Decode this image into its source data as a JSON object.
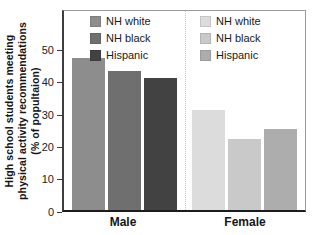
{
  "figure": {
    "ylabel_lines": [
      "High school students meeting",
      "physical activity recommendations",
      "(% of popultaion)"
    ]
  },
  "chart_data": {
    "type": "bar",
    "title": "",
    "ylabel": "High school students meeting physical activity recommendations (% of popultaion)",
    "xlabel": "",
    "categories": [
      "Male",
      "Female"
    ],
    "series": [
      {
        "name": "NH white",
        "values": [
          47,
          31
        ]
      },
      {
        "name": "NH black",
        "values": [
          43,
          22
        ]
      },
      {
        "name": "Hispanic",
        "values": [
          41,
          25
        ]
      }
    ],
    "yticks": [
      0,
      10,
      20,
      30,
      40,
      50
    ],
    "ylim": [
      0,
      62
    ],
    "grid": false,
    "group_separator": "dotted vertical line between Male and Female groups",
    "legend_position": "two legends inside plot top, one per group",
    "colors": {
      "male": [
        "#8d8d8d",
        "#6f6f6f",
        "#424242"
      ],
      "female": [
        "#dcdcdc",
        "#c9c9c9",
        "#adadad"
      ]
    },
    "legends": [
      {
        "group": "Male",
        "entries": [
          {
            "label": "NH white",
            "color": "#8d8d8d"
          },
          {
            "label": "NH black",
            "color": "#6f6f6f"
          },
          {
            "label": "Hispanic",
            "color": "#424242"
          }
        ]
      },
      {
        "group": "Female",
        "entries": [
          {
            "label": "NH white",
            "color": "#dcdcdc"
          },
          {
            "label": "NH black",
            "color": "#c9c9c9"
          },
          {
            "label": "Hispanic",
            "color": "#adadad"
          }
        ]
      }
    ]
  }
}
